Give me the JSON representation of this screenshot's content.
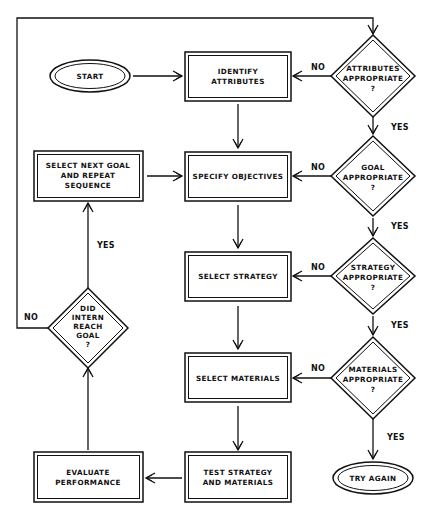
{
  "diagram": {
    "type": "flowchart",
    "nodes": {
      "start": {
        "shape": "ellipse",
        "lines": [
          "START"
        ]
      },
      "identify": {
        "shape": "box",
        "lines": [
          "IDENTIFY",
          "ATTRIBUTES"
        ]
      },
      "attributes_q": {
        "shape": "diamond",
        "lines": [
          "ATTRIBUTES",
          "APPROPRIATE",
          "?"
        ]
      },
      "specify": {
        "shape": "box",
        "lines": [
          "SPECIFY OBJECTIVES"
        ]
      },
      "goal_q": {
        "shape": "diamond",
        "lines": [
          "GOAL",
          "APPROPRIATE",
          "?"
        ]
      },
      "strategy": {
        "shape": "box",
        "lines": [
          "SELECT STRATEGY"
        ]
      },
      "strategy_q": {
        "shape": "diamond",
        "lines": [
          "STRATEGY",
          "APPROPRIATE",
          "?"
        ]
      },
      "materials": {
        "shape": "box",
        "lines": [
          "SELECT MATERIALS"
        ]
      },
      "materials_q": {
        "shape": "diamond",
        "lines": [
          "MATERIALS",
          "APPROPRIATE",
          "?"
        ]
      },
      "test": {
        "shape": "box",
        "lines": [
          "TEST STRATEGY",
          "AND MATERIALS"
        ]
      },
      "evaluate": {
        "shape": "box",
        "lines": [
          "EVALUATE",
          "PERFORMANCE"
        ]
      },
      "intern_q": {
        "shape": "diamond",
        "lines": [
          "DID",
          "INTERN",
          "REACH",
          "GOAL",
          "?"
        ]
      },
      "next_goal": {
        "shape": "box",
        "lines": [
          "SELECT NEXT GOAL",
          "AND REPEAT",
          "SEQUENCE"
        ]
      },
      "try_again": {
        "shape": "ellipse",
        "lines": [
          "TRY AGAIN"
        ]
      }
    },
    "edge_labels": {
      "yes": "YES",
      "no": "NO"
    },
    "edges": [
      {
        "from": "start",
        "to": "identify",
        "label": ""
      },
      {
        "from": "identify",
        "to": "specify",
        "label": ""
      },
      {
        "from": "specify",
        "to": "strategy",
        "label": ""
      },
      {
        "from": "strategy",
        "to": "materials",
        "label": ""
      },
      {
        "from": "materials",
        "to": "test",
        "label": ""
      },
      {
        "from": "test",
        "to": "evaluate",
        "label": ""
      },
      {
        "from": "evaluate",
        "to": "intern_q",
        "label": ""
      },
      {
        "from": "intern_q",
        "to": "next_goal",
        "label": "YES"
      },
      {
        "from": "intern_q",
        "to": "attributes_q",
        "label": "NO"
      },
      {
        "from": "next_goal",
        "to": "specify",
        "label": ""
      },
      {
        "from": "attributes_q",
        "to": "identify",
        "label": "NO"
      },
      {
        "from": "attributes_q",
        "to": "goal_q",
        "label": "YES"
      },
      {
        "from": "goal_q",
        "to": "specify",
        "label": "NO"
      },
      {
        "from": "goal_q",
        "to": "strategy_q",
        "label": "YES"
      },
      {
        "from": "strategy_q",
        "to": "strategy",
        "label": "NO"
      },
      {
        "from": "strategy_q",
        "to": "materials_q",
        "label": "YES"
      },
      {
        "from": "materials_q",
        "to": "materials",
        "label": "NO"
      },
      {
        "from": "materials_q",
        "to": "try_again",
        "label": "YES"
      }
    ]
  }
}
